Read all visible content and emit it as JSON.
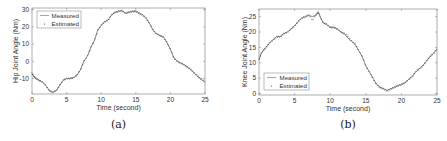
{
  "chart_data": [
    {
      "id": "a",
      "type": "line",
      "caption": "(a)",
      "title": "",
      "xlabel": "Time (second)",
      "ylabel": "Hip Joint Angle (Nm)",
      "xlim": [
        0,
        25
      ],
      "ylim": [
        -19,
        31
      ],
      "xticks": [
        0,
        5,
        10,
        15,
        20,
        25
      ],
      "yticks": [
        -10,
        0,
        10,
        20,
        30
      ],
      "grid": false,
      "legend_position": "upper left",
      "legend": [
        "Measured",
        "Estimated"
      ],
      "series": [
        {
          "name": "Measured",
          "style": "solid line",
          "x": [
            0,
            0.3,
            0.6,
            1,
            1.5,
            2,
            2.5,
            3,
            3.5,
            4,
            4.5,
            5,
            5.5,
            6,
            6.5,
            7,
            7.5,
            8,
            8.5,
            9,
            9.5,
            10,
            10.5,
            11,
            11.5,
            12,
            12.5,
            13,
            13.5,
            14,
            14.5,
            15,
            15.5,
            16,
            16.5,
            17,
            17.5,
            18,
            18.5,
            19,
            19.5,
            20,
            20.5,
            21,
            21.5,
            22,
            22.5,
            23,
            23.5,
            24,
            24.5,
            25
          ],
          "values": [
            -7,
            -9,
            -10,
            -11,
            -12,
            -14,
            -17,
            -18,
            -17,
            -14,
            -11,
            -10,
            -10,
            -9.5,
            -8,
            -5,
            0,
            3,
            8,
            12,
            18,
            21,
            23,
            24,
            27,
            28.5,
            29,
            29.5,
            28,
            28.5,
            29,
            29,
            28,
            27,
            25,
            22,
            18,
            16,
            15,
            14,
            11,
            7,
            2,
            0,
            -1,
            -2,
            -3.5,
            -5,
            -7,
            -9,
            -10.5,
            -12
          ]
        },
        {
          "name": "Estimated",
          "style": "dotted markers",
          "x": [
            0,
            0.3,
            0.6,
            1,
            1.5,
            2,
            2.5,
            3,
            3.5,
            4,
            4.5,
            5,
            5.5,
            6,
            6.5,
            7,
            7.5,
            8,
            8.5,
            9,
            9.5,
            10,
            10.5,
            11,
            11.5,
            12,
            12.5,
            13,
            13.5,
            14,
            14.5,
            15,
            15.5,
            16,
            16.5,
            17,
            17.5,
            18,
            18.5,
            19,
            19.5,
            20,
            20.5,
            21,
            21.5,
            22,
            22.5,
            23,
            23.5,
            24,
            24.5,
            25
          ],
          "values": [
            -7,
            -9,
            -10,
            -11,
            -12,
            -14,
            -17,
            -18,
            -17,
            -14,
            -11,
            -10,
            -10,
            -9.5,
            -8,
            -5,
            0,
            3,
            8,
            12,
            18,
            21,
            23,
            24,
            27,
            28.5,
            29,
            29.5,
            28,
            28.5,
            29,
            29,
            28,
            27,
            25,
            22,
            18,
            16,
            15,
            14,
            11,
            7,
            2,
            0,
            -1,
            -2,
            -3.5,
            -5,
            -7,
            -9,
            -10.5,
            -12
          ]
        }
      ]
    },
    {
      "id": "b",
      "type": "line",
      "caption": "(b)",
      "title": "",
      "xlabel": "Time (second)",
      "ylabel": "Knee Joint Angle (Nm)",
      "xlim": [
        0,
        25
      ],
      "ylim": [
        -0.5,
        27.5
      ],
      "xticks": [
        0,
        5,
        10,
        15,
        20,
        25
      ],
      "yticks": [
        0,
        5,
        10,
        15,
        20,
        25
      ],
      "grid": false,
      "legend_position": "lower left",
      "legend": [
        "Measured",
        "Estimated"
      ],
      "series": [
        {
          "name": "Measured",
          "style": "solid line",
          "x": [
            0,
            0.3,
            0.6,
            1,
            1.5,
            2,
            2.5,
            3,
            3.5,
            4,
            4.5,
            5,
            5.5,
            6,
            6.5,
            7,
            7.5,
            8,
            8.3,
            8.6,
            9,
            9.5,
            10,
            10.5,
            11,
            11.5,
            12,
            12.5,
            13,
            13.5,
            14,
            14.5,
            15,
            15.5,
            16,
            16.5,
            17,
            17.5,
            18,
            18.5,
            19,
            19.5,
            20,
            20.5,
            21,
            21.5,
            22,
            22.5,
            23,
            23.5,
            24,
            24.5,
            25
          ],
          "values": [
            11,
            13,
            14,
            15,
            16.5,
            17.5,
            18.5,
            18.5,
            19.5,
            20,
            21,
            22,
            23.5,
            24.5,
            25,
            25.5,
            25,
            25.5,
            26.5,
            25,
            23,
            22.5,
            21.5,
            21.5,
            21,
            20,
            19.5,
            18,
            17,
            16,
            14,
            12,
            9,
            7,
            5,
            3,
            2,
            1.5,
            1,
            1.5,
            2,
            2.5,
            3,
            3.5,
            4.5,
            5.5,
            7,
            8,
            9,
            10.5,
            12,
            13,
            14.5
          ]
        },
        {
          "name": "Estimated",
          "style": "dotted markers",
          "x": [
            0,
            0.3,
            0.6,
            1,
            1.5,
            2,
            2.5,
            3,
            3.5,
            4,
            4.5,
            5,
            5.5,
            6,
            6.5,
            7,
            7.5,
            8,
            8.3,
            8.6,
            9,
            9.5,
            10,
            10.5,
            11,
            11.5,
            12,
            12.5,
            13,
            13.5,
            14,
            14.5,
            15,
            15.5,
            16,
            16.5,
            17,
            17.5,
            18,
            18.5,
            19,
            19.5,
            20,
            20.5,
            21,
            21.5,
            22,
            22.5,
            23,
            23.5,
            24,
            24.5,
            25
          ],
          "values": [
            11,
            13,
            14,
            15,
            16.5,
            17.5,
            18.5,
            18.5,
            19.5,
            20,
            21,
            22,
            23.5,
            24.5,
            25,
            25.5,
            24,
            25.5,
            26.5,
            25,
            23,
            22.5,
            21.5,
            21.5,
            21,
            20,
            19.5,
            18.5,
            17,
            16,
            14,
            12,
            9,
            7,
            5,
            3,
            2,
            1.5,
            0.8,
            1.5,
            2,
            2.5,
            3,
            3.5,
            4.5,
            5.5,
            7,
            8,
            9,
            10.5,
            12,
            13,
            14.5
          ]
        }
      ]
    }
  ]
}
